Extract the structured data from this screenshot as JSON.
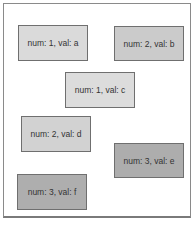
{
  "diagram": {
    "nodes": [
      {
        "id": "a",
        "label": "num: 1, val: a",
        "num": 1,
        "val": "a",
        "x": 18,
        "y": 25,
        "w": 70,
        "h": 36,
        "color": "#dadada"
      },
      {
        "id": "b",
        "label": "num: 2, val: b",
        "num": 2,
        "val": "b",
        "x": 114,
        "y": 26,
        "w": 70,
        "h": 35,
        "color": "#cbcbcb"
      },
      {
        "id": "c",
        "label": "num: 1, val: c",
        "num": 1,
        "val": "c",
        "x": 65,
        "y": 72,
        "w": 70,
        "h": 36,
        "color": "#dcdcdc"
      },
      {
        "id": "d",
        "label": "num: 2, val: d",
        "num": 2,
        "val": "d",
        "x": 21,
        "y": 116,
        "w": 70,
        "h": 36,
        "color": "#d2d2d2"
      },
      {
        "id": "e",
        "label": "num: 3, val: e",
        "num": 3,
        "val": "e",
        "x": 114,
        "y": 143,
        "w": 70,
        "h": 35,
        "color": "#adadad"
      },
      {
        "id": "f",
        "label": "num: 3, val: f",
        "num": 3,
        "val": "f",
        "x": 17,
        "y": 174,
        "w": 70,
        "h": 36,
        "color": "#aeaeae"
      }
    ],
    "colors": {
      "frame_border": "#8a8a8a",
      "node_border": "#6f6f6f",
      "num_1": "#dadada",
      "num_2": "#cdcdcd",
      "num_3": "#adadad"
    }
  }
}
